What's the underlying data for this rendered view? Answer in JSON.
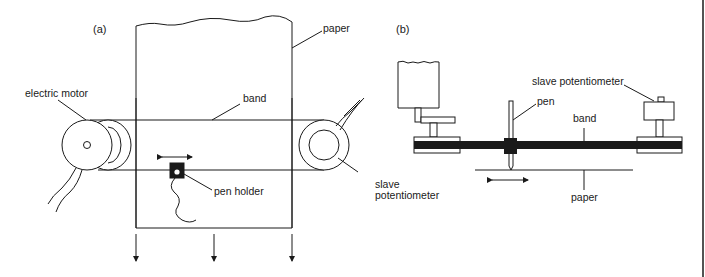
{
  "figure": {
    "panel_a": {
      "label": "(a)",
      "annotations": {
        "paper": "paper",
        "electric_motor": "electric motor",
        "band": "band",
        "pen_holder": "pen holder",
        "slave_potentiometer_line1": "slave",
        "slave_potentiometer_line2": "potentiometer"
      }
    },
    "panel_b": {
      "label": "(b)",
      "annotations": {
        "slave_potentiometer": "slave potentiometer",
        "pen": "pen",
        "band": "band",
        "paper": "paper"
      }
    },
    "colors": {
      "ink": "#1a1a1a",
      "background": "#ffffff"
    }
  }
}
